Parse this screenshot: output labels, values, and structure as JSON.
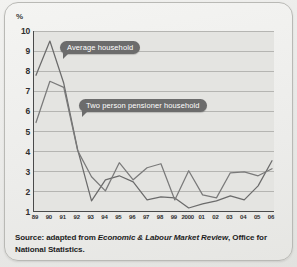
{
  "chart_data": {
    "type": "line",
    "title": "",
    "subtitle": "",
    "xlabel": "",
    "ylabel": "%",
    "unit_label": "%",
    "ylim": [
      1,
      10
    ],
    "yticks": [
      10,
      9,
      8,
      7,
      6,
      5,
      4,
      3,
      2,
      1
    ],
    "grid": true,
    "grid_axis": "y",
    "legend_position": "inline-callout",
    "categories": [
      "89",
      "90",
      "91",
      "92",
      "93",
      "94",
      "95",
      "96",
      "97",
      "98",
      "99",
      "2000",
      "01",
      "02",
      "03",
      "04",
      "05",
      "06"
    ],
    "series": [
      {
        "name": "Average household",
        "color": "#6b6b6b",
        "values": [
          7.8,
          9.5,
          7.4,
          4.1,
          1.55,
          2.6,
          2.8,
          2.5,
          1.6,
          1.75,
          1.7,
          1.2,
          1.4,
          1.55,
          1.8,
          1.6,
          2.3,
          3.55
        ]
      },
      {
        "name": "Two person pensioner household",
        "color": "#7a7a7a",
        "values": [
          5.45,
          7.5,
          7.2,
          4.05,
          2.75,
          2.05,
          3.45,
          2.6,
          3.2,
          3.4,
          1.6,
          3.05,
          1.85,
          1.7,
          2.95,
          3.0,
          2.8,
          3.15
        ]
      }
    ],
    "annotations": [
      {
        "text": "Average household",
        "anchor_x": "90",
        "anchor_y": 9.0
      },
      {
        "text": "Two person pensioner household",
        "anchor_x": "92",
        "anchor_y": 6.0
      }
    ]
  },
  "callouts": {
    "average": "Average household",
    "pensioner": "Two person pensioner household"
  },
  "source": {
    "prefix": "Source: adapted from ",
    "italic": "Economic & Labour Market Review",
    "suffix": ", Office for National Statistics."
  }
}
